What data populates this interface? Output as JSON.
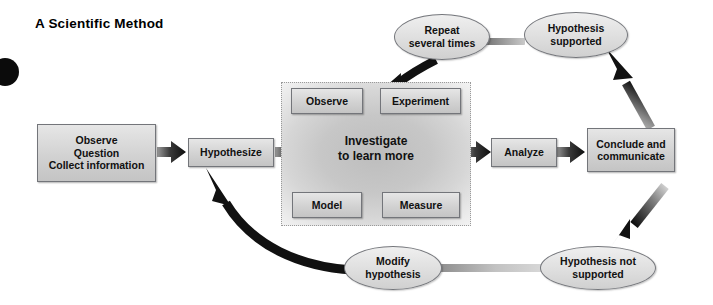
{
  "page": {
    "title": "A Scientific Method",
    "bullet_icon": "black-dot-icon",
    "background_color": "#ffffff"
  },
  "diagram": {
    "type": "flowchart",
    "name": "scientific-method-flowchart",
    "boxes": [
      {
        "id": "observe-question-collect",
        "label": "Observe\nQuestion\nCollect information"
      },
      {
        "id": "hypothesize",
        "label": "Hypothesize"
      },
      {
        "id": "observe",
        "label": "Observe"
      },
      {
        "id": "experiment",
        "label": "Experiment"
      },
      {
        "id": "model",
        "label": "Model"
      },
      {
        "id": "measure",
        "label": "Measure"
      },
      {
        "id": "analyze",
        "label": "Analyze"
      },
      {
        "id": "conclude-communicate",
        "label": "Conclude and\ncommunicate"
      }
    ],
    "investigate_label": "Investigate\nto learn more",
    "ellipses": [
      {
        "id": "repeat-several-times",
        "label": "Repeat\nseveral times"
      },
      {
        "id": "hypothesis-supported",
        "label": "Hypothesis\nsupported"
      },
      {
        "id": "hypothesis-not-supported",
        "label": "Hypothesis not\nsupported"
      },
      {
        "id": "modify-hypothesis",
        "label": "Modify\nhypothesis"
      }
    ],
    "connectors": [
      {
        "from": "observe-question-collect",
        "to": "hypothesize",
        "style": "straight-arrow"
      },
      {
        "from": "hypothesize",
        "to": "investigate",
        "style": "straight-arrow"
      },
      {
        "from": "investigate",
        "to": "analyze",
        "style": "straight-arrow"
      },
      {
        "from": "analyze",
        "to": "conclude-communicate",
        "style": "straight-arrow"
      },
      {
        "from": "repeat-several-times",
        "to": "investigate",
        "style": "curved-black-arrow"
      },
      {
        "from": "hypothesis-supported",
        "to": "repeat-several-times",
        "style": "gray-bar"
      },
      {
        "from": "conclude-communicate",
        "to": "hypothesis-supported",
        "style": "gradient-arrow-up"
      },
      {
        "from": "conclude-communicate",
        "to": "hypothesis-not-supported",
        "style": "gradient-arrow-down"
      },
      {
        "from": "hypothesis-not-supported",
        "to": "modify-hypothesis",
        "style": "gray-bar"
      },
      {
        "from": "modify-hypothesis",
        "to": "hypothesize",
        "style": "curved-black-arrow"
      }
    ],
    "colors": {
      "box_fill": "#d7d7d7",
      "box_border": "#73757a",
      "arrow_black": "#111111",
      "arrow_gray": "#b7b7b7",
      "zone_border": "#9a9a9a"
    }
  }
}
